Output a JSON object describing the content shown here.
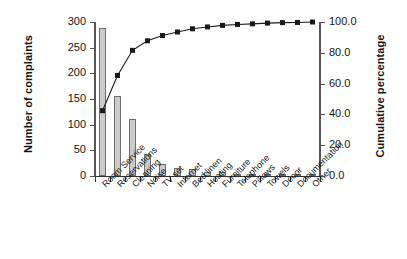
{
  "chart_data": {
    "type": "bar",
    "title": "",
    "subtitle": "",
    "xlabel": "",
    "ylabel": "Number of complaints",
    "y2label": "Cumulative percentage",
    "grid": false,
    "legend": "none",
    "ylim": [
      0,
      300
    ],
    "y2lim": [
      0,
      100
    ],
    "yticks": [
      "0",
      "50",
      "100",
      "150",
      "200",
      "250",
      "300"
    ],
    "ytick_values": [
      0,
      50,
      100,
      150,
      200,
      250,
      300
    ],
    "y2ticks": [
      "0.0",
      "20.0",
      "40.0",
      "60.0",
      "80.0",
      "100.0"
    ],
    "y2tick_values": [
      0,
      20,
      40,
      60,
      80,
      100
    ],
    "categories": [
      "Room Service",
      "Reservations",
      "Cleaning",
      "Noise",
      "TV set",
      "Internet",
      "Bed linen",
      "Heating",
      "Furniture",
      "Telephone",
      "Pillows",
      "Towels",
      "Décor",
      "Documentation",
      "Other"
    ],
    "series": [
      {
        "name": "Number of complaints",
        "type": "bar",
        "axis": "left",
        "color": "#cbcbcb",
        "edge_color": "#6e6e6e",
        "values": [
          288,
          156,
          111,
          42,
          23,
          16,
          14,
          8,
          7,
          4,
          3,
          3,
          2,
          1,
          2
        ]
      },
      {
        "name": "Cumulative percentage",
        "type": "line",
        "axis": "right",
        "color": "#1a1a1a",
        "marker": "square",
        "values": [
          42.4,
          65.3,
          81.6,
          87.8,
          91.2,
          93.5,
          95.6,
          96.8,
          97.8,
          98.4,
          98.8,
          99.3,
          99.6,
          99.7,
          100.0
        ]
      }
    ]
  },
  "colors": {
    "bar_fill": "#cbcbcb",
    "bar_edge": "#6e6e6e",
    "line": "#1a1a1a",
    "axis": "#555555",
    "text": "#141414",
    "background": "#ffffff"
  }
}
